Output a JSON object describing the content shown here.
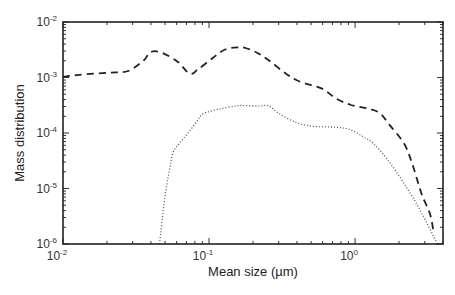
{
  "chart_data": {
    "type": "line",
    "title": "",
    "xlabel": "Mean size (µm)",
    "ylabel": "Mass distribution",
    "xscale": "log",
    "yscale": "log",
    "xlim": [
      0.01,
      4.0
    ],
    "ylim": [
      1e-06,
      0.01
    ],
    "grid": false,
    "legend": null,
    "x_ticks": [
      {
        "value": 0.01,
        "base": "10",
        "exp": "-2"
      },
      {
        "value": 0.1,
        "base": "10",
        "exp": "-1"
      },
      {
        "value": 1,
        "base": "10",
        "exp": "0"
      }
    ],
    "y_ticks": [
      {
        "value": 0.01,
        "base": "10",
        "exp": "-2"
      },
      {
        "value": 0.001,
        "base": "10",
        "exp": "-3"
      },
      {
        "value": 0.0001,
        "base": "10",
        "exp": "-4"
      },
      {
        "value": 1e-05,
        "base": "10",
        "exp": "-5"
      },
      {
        "value": 1e-06,
        "base": "10",
        "exp": "-6"
      }
    ],
    "series": [
      {
        "name": "dashed",
        "style": "dashed",
        "color": "#222222",
        "x": [
          0.01,
          0.0129,
          0.0207,
          0.0279,
          0.0358,
          0.0395,
          0.0466,
          0.0606,
          0.0737,
          0.0845,
          0.106,
          0.129,
          0.159,
          0.178,
          0.213,
          0.259,
          0.338,
          0.424,
          0.594,
          0.738,
          0.938,
          1.19,
          1.47,
          1.72,
          2.17,
          2.46,
          2.86,
          3.27,
          3.46
        ],
        "y": [
          0.00102,
          0.00112,
          0.00122,
          0.00131,
          0.00205,
          0.00285,
          0.00285,
          0.00195,
          0.00117,
          0.00142,
          0.00225,
          0.0032,
          0.0035,
          0.0034,
          0.0028,
          0.002,
          0.00116,
          0.00083,
          0.00063,
          0.00042,
          0.00032,
          0.00028,
          0.00023,
          0.00014,
          6.4e-05,
          2.8e-05,
          7.9e-06,
          3.4e-06,
          1.5e-06
        ]
      },
      {
        "name": "dotted",
        "style": "dotted",
        "color": "#555555",
        "x": [
          0.0458,
          0.0497,
          0.0531,
          0.0569,
          0.0634,
          0.0725,
          0.083,
          0.0918,
          0.118,
          0.155,
          0.182,
          0.224,
          0.256,
          0.301,
          0.394,
          0.504,
          0.729,
          0.905,
          1.12,
          1.35,
          1.7,
          2.17,
          2.8,
          3.66
        ],
        "y": [
          1e-06,
          6.6e-06,
          1.9e-05,
          4.5e-05,
          6.7e-05,
          0.000103,
          0.000164,
          0.000225,
          0.00027,
          0.00031,
          0.00031,
          0.000305,
          0.00031,
          0.000225,
          0.000155,
          0.000133,
          0.000127,
          0.000117,
          8.8e-05,
          6.3e-05,
          3.1e-05,
          1.22e-05,
          4e-06,
          1e-06
        ]
      }
    ]
  }
}
